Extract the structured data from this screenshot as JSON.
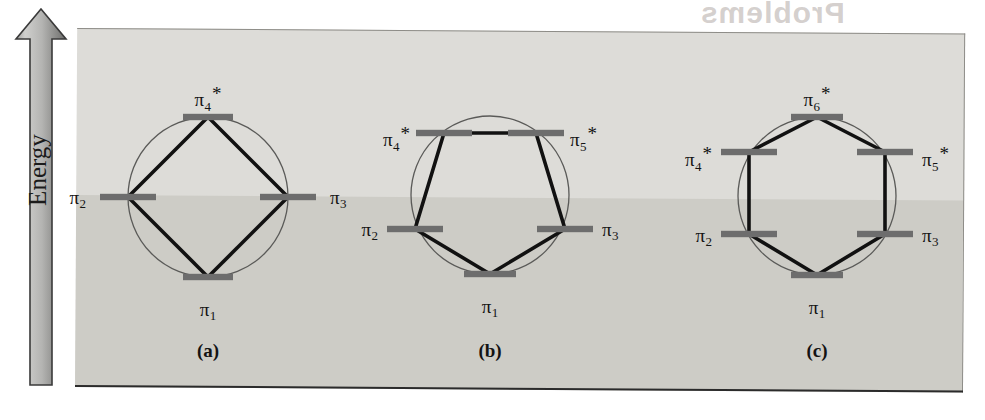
{
  "figure": {
    "axis": {
      "label": "Energy",
      "direction": "up"
    },
    "ghost_text": "Problems",
    "colors": {
      "band_upper": "#dddcd8",
      "band_lower": "#cdccc6",
      "level_bar": "#6d6d6d",
      "bond_line": "#111111",
      "circle_outline": "#5a5a58",
      "arrow_fill_light": "#d2d2d0",
      "arrow_fill_dark": "#6f6f6f",
      "baseline": "#2b2b2b"
    },
    "panels": [
      {
        "caption": "(a)",
        "polygon": "square",
        "vertices": 4,
        "caption_x": 208,
        "caption_y": 340,
        "circle": {
          "cx": 208,
          "cy": 197,
          "r": 80
        },
        "levels": [
          {
            "id": "pi1",
            "pi": "π",
            "sub": "1",
            "star": "",
            "x": 208,
            "y": 277,
            "bar_w": 50,
            "label_x": 208,
            "label_y": 300,
            "align": "c"
          },
          {
            "id": "pi2",
            "pi": "π",
            "sub": "2",
            "star": "",
            "x": 128,
            "y": 197,
            "bar_w": 56,
            "label_x": 86,
            "label_y": 188,
            "align": "r"
          },
          {
            "id": "pi3",
            "pi": "π",
            "sub": "3",
            "star": "",
            "x": 288,
            "y": 197,
            "bar_w": 56,
            "label_x": 330,
            "label_y": 188,
            "align": "l"
          },
          {
            "id": "pi4s",
            "pi": "π",
            "sub": "4",
            "star": "*",
            "x": 208,
            "y": 117,
            "bar_w": 50,
            "label_x": 208,
            "label_y": 84,
            "align": "c"
          }
        ],
        "bonds": [
          [
            208,
            277,
            128,
            197
          ],
          [
            128,
            197,
            208,
            117
          ],
          [
            208,
            117,
            288,
            197
          ],
          [
            288,
            197,
            208,
            277
          ]
        ]
      },
      {
        "caption": "(b)",
        "polygon": "pentagon",
        "vertices": 5,
        "caption_x": 490,
        "caption_y": 340,
        "circle": {
          "cx": 490,
          "cy": 195,
          "r": 79
        },
        "levels": [
          {
            "id": "pi1",
            "pi": "π",
            "sub": "1",
            "star": "",
            "x": 490,
            "y": 274,
            "bar_w": 52,
            "label_x": 490,
            "label_y": 297,
            "align": "c"
          },
          {
            "id": "pi2",
            "pi": "π",
            "sub": "2",
            "star": "",
            "x": 415,
            "y": 229,
            "bar_w": 56,
            "label_x": 378,
            "label_y": 220,
            "align": "r"
          },
          {
            "id": "pi3",
            "pi": "π",
            "sub": "3",
            "star": "",
            "x": 565,
            "y": 229,
            "bar_w": 56,
            "label_x": 602,
            "label_y": 220,
            "align": "l"
          },
          {
            "id": "pi4s",
            "pi": "π",
            "sub": "4",
            "star": "*",
            "x": 444,
            "y": 133,
            "bar_w": 56,
            "label_x": 410,
            "label_y": 124,
            "align": "r"
          },
          {
            "id": "pi5s",
            "pi": "π",
            "sub": "5",
            "star": "*",
            "x": 536,
            "y": 133,
            "bar_w": 56,
            "label_x": 570,
            "label_y": 124,
            "align": "l"
          }
        ],
        "bonds": [
          [
            490,
            274,
            415,
            229
          ],
          [
            415,
            229,
            444,
            133
          ],
          [
            444,
            133,
            536,
            133
          ],
          [
            536,
            133,
            565,
            229
          ],
          [
            565,
            229,
            490,
            274
          ]
        ]
      },
      {
        "caption": "(c)",
        "polygon": "hexagon",
        "vertices": 6,
        "caption_x": 817,
        "caption_y": 340,
        "circle": {
          "cx": 817,
          "cy": 196,
          "r": 79
        },
        "levels": [
          {
            "id": "pi1",
            "pi": "π",
            "sub": "1",
            "star": "",
            "x": 817,
            "y": 275,
            "bar_w": 52,
            "label_x": 817,
            "label_y": 298,
            "align": "c"
          },
          {
            "id": "pi2",
            "pi": "π",
            "sub": "2",
            "star": "",
            "x": 749,
            "y": 234,
            "bar_w": 56,
            "label_x": 712,
            "label_y": 226,
            "align": "r"
          },
          {
            "id": "pi3",
            "pi": "π",
            "sub": "3",
            "star": "",
            "x": 885,
            "y": 234,
            "bar_w": 56,
            "label_x": 922,
            "label_y": 226,
            "align": "l"
          },
          {
            "id": "pi4s",
            "pi": "π",
            "sub": "4",
            "star": "*",
            "x": 749,
            "y": 152,
            "bar_w": 56,
            "label_x": 712,
            "label_y": 144,
            "align": "r"
          },
          {
            "id": "pi5s",
            "pi": "π",
            "sub": "5",
            "star": "*",
            "x": 885,
            "y": 152,
            "bar_w": 56,
            "label_x": 922,
            "label_y": 144,
            "align": "l"
          },
          {
            "id": "pi6s",
            "pi": "π",
            "sub": "6",
            "star": "*",
            "x": 817,
            "y": 117,
            "bar_w": 52,
            "label_x": 817,
            "label_y": 84,
            "align": "c"
          }
        ],
        "bonds": [
          [
            817,
            275,
            749,
            234
          ],
          [
            749,
            234,
            749,
            152
          ],
          [
            749,
            152,
            817,
            117
          ],
          [
            817,
            117,
            885,
            152
          ],
          [
            885,
            152,
            885,
            234
          ],
          [
            885,
            234,
            817,
            275
          ]
        ]
      }
    ]
  }
}
